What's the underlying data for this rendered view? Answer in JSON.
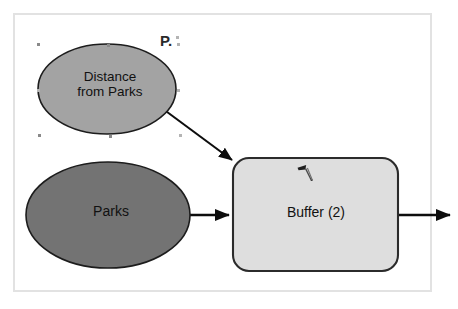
{
  "document": {
    "type": "geoprocessing-model-diagram",
    "background_color": "#ffffff",
    "frame_border_color": "#e2e2e2"
  },
  "annotations": {
    "stray_text": "P."
  },
  "nodes": [
    {
      "id": "distance-from-parks",
      "kind": "data-oval",
      "label": "Distance\nfrom Parks",
      "label_line1": "Distance",
      "label_line2": "from Parks",
      "fill_color": "#a3a3a3",
      "stroke_color": "#1c1c1c",
      "selected": true
    },
    {
      "id": "parks",
      "kind": "data-oval",
      "label": "Parks",
      "fill_color": "#737373",
      "stroke_color": "#1c1c1c",
      "selected": false
    },
    {
      "id": "buffer-2",
      "kind": "tool-rounded-rect",
      "label": "Buffer (2)",
      "fill_color": "#dedede",
      "stroke_color": "#2b2b2b",
      "selected": false
    }
  ],
  "connectors": [
    {
      "id": "distance-to-buffer",
      "from": "distance-from-parks",
      "to": "buffer-2",
      "style": "solid-arrow",
      "color": "#0d0d0d"
    },
    {
      "id": "parks-to-buffer",
      "from": "parks",
      "to": "buffer-2",
      "style": "solid-arrow",
      "color": "#0d0d0d"
    },
    {
      "id": "buffer-to-output",
      "from": "buffer-2",
      "to": "output",
      "style": "solid-arrow",
      "color": "#0d0d0d"
    }
  ],
  "icons": {
    "tool_cursor": "pen-tool-cursor-icon"
  },
  "selection_handles": [
    {
      "x": 37,
      "y": 43
    },
    {
      "x": 107,
      "y": 44
    },
    {
      "x": 177,
      "y": 43
    },
    {
      "x": 37,
      "y": 89
    },
    {
      "x": 177,
      "y": 89
    },
    {
      "x": 38,
      "y": 134
    },
    {
      "x": 109,
      "y": 135
    },
    {
      "x": 179,
      "y": 134
    },
    {
      "x": 176,
      "y": 36
    }
  ]
}
